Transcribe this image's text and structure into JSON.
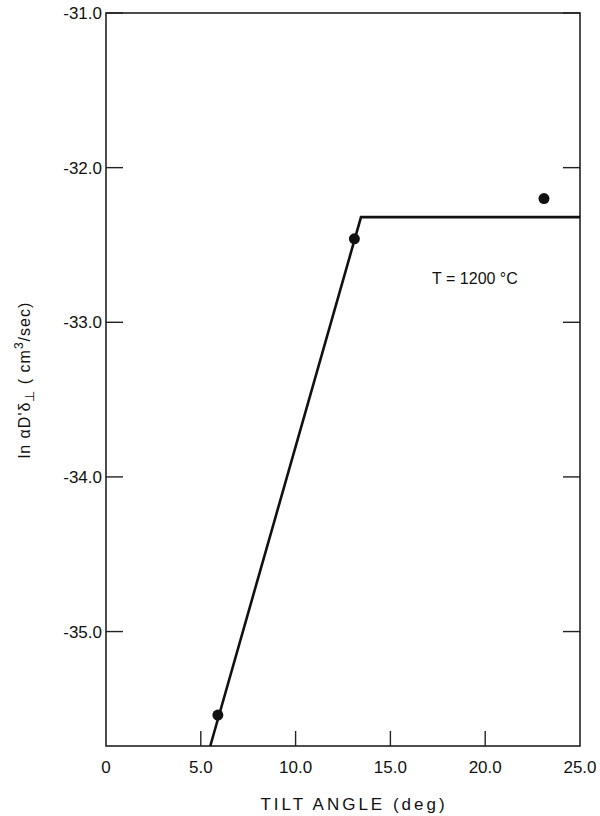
{
  "chart_data": {
    "type": "line",
    "title": "",
    "xlabel": "TILT ANGLE (deg)",
    "ylabel": "ln αD'δ⊥ (cm³/sec)",
    "ylabel_parts": {
      "prefix": "ln",
      "symbol": "αD'δ",
      "subscript": "⊥",
      "units_open": "( cm",
      "units_sup": "3",
      "units_close": "/sec)"
    },
    "xlim": [
      0,
      25.0
    ],
    "ylim": [
      -35.74,
      -31.0
    ],
    "grid": false,
    "x_ticks": [
      0,
      5.0,
      10.0,
      15.0,
      20.0,
      25.0
    ],
    "x_tick_labels": [
      "0",
      "5.0",
      "10.0",
      "15.0",
      "20.0",
      "25.0"
    ],
    "y_ticks": [
      -31.0,
      -32.0,
      -33.0,
      -34.0,
      -35.0
    ],
    "y_tick_labels": [
      "-31.0",
      "-32.0",
      "-33.0",
      "-34.0",
      "-35.0"
    ],
    "annotations": [
      {
        "text": "T = 1200 °C",
        "x": 17.2,
        "y": -32.75
      }
    ],
    "series": [
      {
        "name": "measured",
        "kind": "scatter",
        "x": [
          5.9,
          13.1,
          23.1
        ],
        "y": [
          -35.54,
          -32.46,
          -32.2
        ]
      },
      {
        "name": "fit",
        "kind": "line",
        "x": [
          5.5,
          13.45,
          25.0
        ],
        "y": [
          -35.74,
          -32.32,
          -32.32
        ]
      }
    ]
  }
}
